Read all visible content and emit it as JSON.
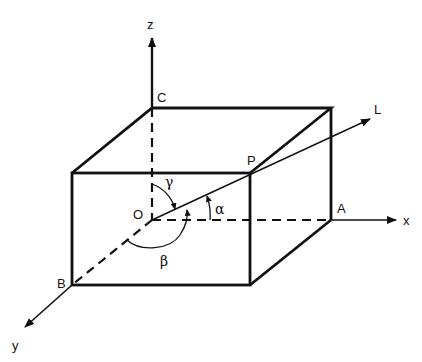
{
  "figure": {
    "type": "3D direction-cosine diagram",
    "axes": {
      "x": "x",
      "y": "y",
      "z": "z"
    },
    "points": {
      "origin": "O",
      "A": "A",
      "B": "B",
      "C": "C",
      "P": "P"
    },
    "line_label": "L",
    "angles": {
      "alpha": "α",
      "beta": "β",
      "gamma": "γ"
    },
    "colors": {
      "ink": "#111111",
      "background": "#ffffff"
    }
  }
}
